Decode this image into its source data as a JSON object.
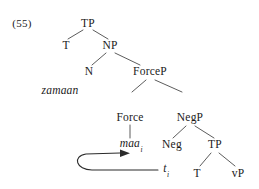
{
  "figure": {
    "example_number": "(55)",
    "background_color": "#ffffff",
    "line_color": "#4a4a4a",
    "text_color": "#1a1a1a",
    "width": 259,
    "height": 189
  },
  "nodes": {
    "tp_top": "TP",
    "t_spec": "T",
    "np": "NP",
    "n": "N",
    "zamaan": "zamaan",
    "forcep": "ForceP",
    "force": "Force",
    "maa": "maa",
    "maa_index": "i",
    "negp": "NegP",
    "neg": "Neg",
    "tp_low": "TP",
    "trace": "t",
    "trace_index": "i",
    "t_low": "T",
    "vp": "vP"
  },
  "movement": {
    "label": "head-movement-arrow",
    "from": "trace",
    "to": "maa"
  }
}
